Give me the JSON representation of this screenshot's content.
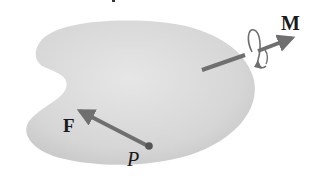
{
  "diagram": {
    "colors": {
      "body_fill_light": "#e4e4e4",
      "body_fill_dark": "#c9c9c9",
      "vector": "#6f6f6f",
      "point": "#555555",
      "label": "#1a1a1a"
    },
    "labels": {
      "force": "F",
      "moment": "M",
      "point": "P"
    }
  }
}
